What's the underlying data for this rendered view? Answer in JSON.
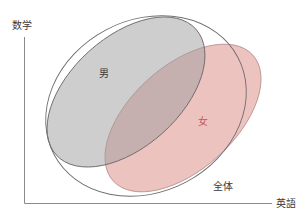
{
  "diagram": {
    "type": "ellipse-overlap",
    "axes": {
      "y_label": "数学",
      "x_label": "英語"
    },
    "sets": [
      {
        "id": "whole",
        "label": "全体",
        "fill": "none",
        "stroke": "#6e6e6e"
      },
      {
        "id": "male",
        "label": "男",
        "fill": "#c9c9c9",
        "stroke": "#6e6a6a"
      },
      {
        "id": "female",
        "label": "女",
        "fill": "#eab9b5",
        "stroke": "#b58c8a"
      }
    ],
    "colors": {
      "overlap": "#b59a9b",
      "axis": "#8a8a8a",
      "text": "#3a3a3a",
      "female_text": "#c8555a"
    }
  }
}
